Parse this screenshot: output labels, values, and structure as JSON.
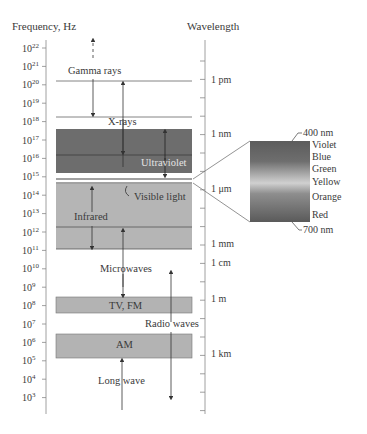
{
  "axes": {
    "frequency_title": "Frequency, Hz",
    "wavelength_title": "Wavelength",
    "frequency_ticks": [
      {
        "base": "10",
        "exp": "22"
      },
      {
        "base": "10",
        "exp": "21"
      },
      {
        "base": "10",
        "exp": "20"
      },
      {
        "base": "10",
        "exp": "19"
      },
      {
        "base": "10",
        "exp": "18"
      },
      {
        "base": "10",
        "exp": "17"
      },
      {
        "base": "10",
        "exp": "16"
      },
      {
        "base": "10",
        "exp": "15"
      },
      {
        "base": "10",
        "exp": "14"
      },
      {
        "base": "10",
        "exp": "13"
      },
      {
        "base": "10",
        "exp": "12"
      },
      {
        "base": "10",
        "exp": "11"
      },
      {
        "base": "10",
        "exp": "10"
      },
      {
        "base": "10",
        "exp": "9"
      },
      {
        "base": "10",
        "exp": "8"
      },
      {
        "base": "10",
        "exp": "7"
      },
      {
        "base": "10",
        "exp": "6"
      },
      {
        "base": "10",
        "exp": "5"
      },
      {
        "base": "10",
        "exp": "4"
      },
      {
        "base": "10",
        "exp": "3"
      }
    ],
    "wavelength_labels": [
      "1 pm",
      "1 nm",
      "1 μm",
      "1 mm",
      "1 cm",
      "1 m",
      "1 km"
    ]
  },
  "bands": {
    "gamma": "Gamma rays",
    "xrays": "X-rays",
    "uv": "Ultraviolet",
    "visible": "Visible light",
    "infrared": "Infrared",
    "microwaves": "Microwaves",
    "tvfm": "TV, FM",
    "radio": "Radio waves",
    "am": "AM",
    "longwave": "Long wave"
  },
  "visible_inset": {
    "top_label": "400 nm",
    "bottom_label": "700 nm",
    "colors": [
      "Violet",
      "Blue",
      "Green",
      "Yellow",
      "Orange",
      "Red"
    ]
  }
}
